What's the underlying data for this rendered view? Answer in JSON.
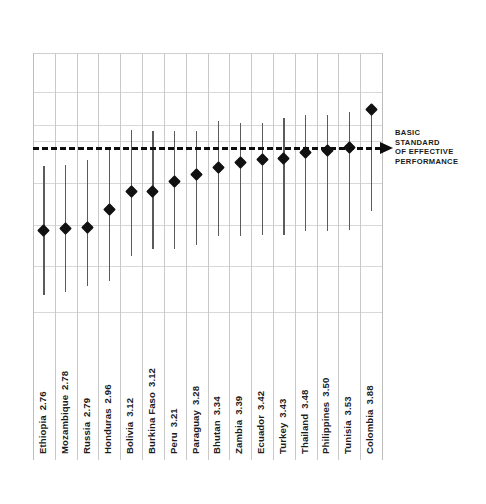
{
  "chart_data": {
    "type": "scatter",
    "title": "",
    "subtitle": "",
    "xlabel": "",
    "ylabel": "",
    "ylim": [
      2.0,
      4.4
    ],
    "grid": true,
    "legend_position": "none",
    "annotations": [
      {
        "name": "basic-standard-line",
        "lines": [
          "BASIC",
          "STANDARD",
          "OF EFFECTIVE",
          "PERFORMANCE"
        ],
        "style": "dashed-arrow",
        "value": 3.9
      }
    ],
    "categories": [
      "Ethiopia",
      "Mozambique",
      "Russia",
      "Honduras",
      "Bolivia",
      "Burkina Faso",
      "Peru",
      "Paraguay",
      "Bhutan",
      "Zambia",
      "Ecuador",
      "Turkey",
      "Thailand",
      "Philippines",
      "Tunisia",
      "Colombia"
    ],
    "values": [
      2.76,
      2.78,
      2.79,
      2.96,
      3.12,
      3.12,
      3.21,
      3.28,
      3.34,
      3.39,
      3.42,
      3.43,
      3.48,
      3.5,
      3.53,
      3.88
    ],
    "value_labels": [
      "2.76",
      "2.78",
      "2.79",
      "2.96",
      "3.12",
      "3.12",
      "3.21",
      "3.28",
      "3.34",
      "3.39",
      "3.42",
      "3.43",
      "3.48",
      "3.50",
      "3.53",
      "3.88"
    ],
    "error_low": [
      2.17,
      2.19,
      2.25,
      2.3,
      2.53,
      2.59,
      2.59,
      2.63,
      2.71,
      2.71,
      2.72,
      2.72,
      2.76,
      2.76,
      2.77,
      2.94
    ],
    "error_high": [
      3.36,
      3.37,
      3.41,
      3.53,
      3.69,
      3.68,
      3.68,
      3.68,
      3.77,
      3.75,
      3.75,
      3.8,
      3.83,
      3.83,
      3.86,
      3.88
    ]
  },
  "labels": [
    {
      "name": "Ethiopia",
      "value": "2.76"
    },
    {
      "name": "Mozambique",
      "value": "2.78"
    },
    {
      "name": "Russia",
      "value": "2.79"
    },
    {
      "name": "Honduras",
      "value": "2.96"
    },
    {
      "name": "Bolivia",
      "value": "3.12"
    },
    {
      "name": "Burkina Faso",
      "value": "3.12"
    },
    {
      "name": "Peru",
      "value": "3.21"
    },
    {
      "name": "Paraguay",
      "value": "3.28"
    },
    {
      "name": "Bhutan",
      "value": "3.34"
    },
    {
      "name": "Zambia",
      "value": "3.39"
    },
    {
      "name": "Ecuador",
      "value": "3.42"
    },
    {
      "name": "Turkey",
      "value": "3.43"
    },
    {
      "name": "Thailand",
      "value": "3.48"
    },
    {
      "name": "Philippines",
      "value": "3.50"
    },
    {
      "name": "Tunisia",
      "value": "3.53"
    },
    {
      "name": "Colombia",
      "value": "3.88"
    }
  ],
  "benchmark_note": {
    "line1": "BASIC",
    "line2": "STANDARD",
    "line3": "OF EFFECTIVE",
    "line4": "PERFORMANCE"
  },
  "colors": {
    "marker": "#111111",
    "whisker": "#5b5b5b",
    "grid": "#d8d8d8",
    "benchmark": "#0d0d0d",
    "text": "#1c1c1c",
    "background": "#ffffff"
  }
}
